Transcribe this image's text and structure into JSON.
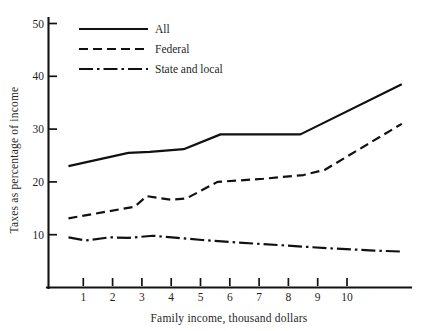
{
  "chart_data": {
    "type": "line",
    "title": "",
    "xlabel": "Family income, thousand dollars",
    "ylabel": "Taxes as percentage of income",
    "xlim": [
      0,
      11.8
    ],
    "ylim": [
      0,
      50
    ],
    "xticks": [
      1,
      2,
      3,
      4,
      5,
      6,
      7,
      8,
      9,
      10
    ],
    "xtick_labels": [
      "1",
      "2",
      "3",
      "4",
      "5",
      "6",
      "7",
      "8",
      "9",
      "10"
    ],
    "yticks": [
      10,
      20,
      30,
      40,
      50
    ],
    "ytick_labels": [
      "10",
      "20",
      "30",
      "40",
      "50"
    ],
    "grid": false,
    "legend_position": "top-left",
    "series": [
      {
        "name": "All",
        "style": "solid",
        "x": [
          0.65,
          2.6,
          3.3,
          4.4,
          5.6,
          8.2,
          11.5
        ],
        "values": [
          23.0,
          25.5,
          25.7,
          26.2,
          29.0,
          29.0,
          38.5
        ]
      },
      {
        "name": "Federal",
        "style": "dashed",
        "x": [
          0.65,
          2.8,
          3.2,
          4.0,
          4.5,
          5.5,
          7.0,
          8.3,
          9.0,
          11.5
        ],
        "values": [
          13.1,
          15.3,
          17.3,
          16.6,
          16.9,
          20.0,
          20.6,
          21.3,
          22.3,
          31.0
        ]
      },
      {
        "name": "State and local",
        "style": "dash-dot",
        "x": [
          0.65,
          1.2,
          2.0,
          2.6,
          3.4,
          4.2,
          5.0,
          6.2,
          7.6,
          9.2,
          10.6,
          11.5
        ],
        "values": [
          9.5,
          8.9,
          9.5,
          9.4,
          9.8,
          9.4,
          9.0,
          8.5,
          8.0,
          7.4,
          7.0,
          6.8
        ]
      }
    ]
  },
  "legend": {
    "items": [
      {
        "label": "All",
        "style": "solid"
      },
      {
        "label": "Federal",
        "style": "dashed"
      },
      {
        "label": "State and local",
        "style": "dash-dot"
      }
    ]
  },
  "axes": {
    "y_title": "Taxes as percentage of income",
    "x_title": "Family income, thousand dollars",
    "y_tick_labels": [
      "50",
      "40",
      "30",
      "20",
      "10"
    ],
    "x_tick_labels": [
      "1",
      "2",
      "3",
      "4",
      "5",
      "6",
      "7",
      "8",
      "9",
      "10"
    ]
  },
  "colors": {
    "ink": "#111111",
    "background": "#ffffff"
  }
}
